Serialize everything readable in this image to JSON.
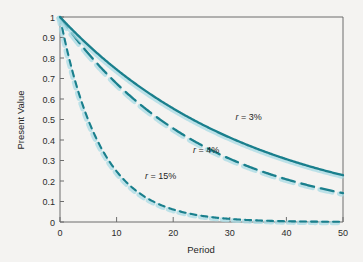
{
  "chart_data": {
    "type": "line",
    "title": "",
    "xlabel": "Period",
    "ylabel": "Present Value",
    "xlim": [
      0,
      50
    ],
    "ylim": [
      0,
      1
    ],
    "grid": false,
    "legend_position": "inline-annotations",
    "xticks": [
      "0",
      "10",
      "20",
      "30",
      "40",
      "50"
    ],
    "xtick_values": [
      0,
      10,
      20,
      30,
      40,
      50
    ],
    "yticks": [
      "0",
      "0.1",
      "0.2",
      "0.3",
      "0.4",
      "0.5",
      "0.6",
      "0.7",
      "0.8",
      "0.9",
      "1"
    ],
    "ytick_values": [
      0,
      0.1,
      0.2,
      0.3,
      0.4,
      0.5,
      0.6,
      0.7,
      0.8,
      0.9,
      1
    ],
    "x": [
      0,
      2,
      4,
      6,
      8,
      10,
      12,
      14,
      16,
      18,
      20,
      22,
      24,
      26,
      28,
      30,
      32,
      34,
      36,
      38,
      40,
      42,
      44,
      46,
      48,
      50
    ],
    "series": [
      {
        "name": "r = 3%",
        "rate": 0.03,
        "style": "solid",
        "color": "#1a7f8c",
        "values": [
          1.0,
          0.943,
          0.888,
          0.837,
          0.789,
          0.744,
          0.701,
          0.661,
          0.623,
          0.587,
          0.554,
          0.522,
          0.492,
          0.464,
          0.437,
          0.412,
          0.388,
          0.366,
          0.345,
          0.325,
          0.307,
          0.289,
          0.272,
          0.257,
          0.242,
          0.228
        ]
      },
      {
        "name": "r = 4%",
        "rate": 0.04,
        "style": "long-dash",
        "color": "#1a7f8c",
        "values": [
          1.0,
          0.925,
          0.855,
          0.79,
          0.731,
          0.676,
          0.625,
          0.577,
          0.534,
          0.494,
          0.456,
          0.422,
          0.39,
          0.361,
          0.333,
          0.308,
          0.285,
          0.264,
          0.244,
          0.225,
          0.208,
          0.193,
          0.178,
          0.165,
          0.152,
          0.141
        ]
      },
      {
        "name": "r = 15%",
        "rate": 0.15,
        "style": "short-dash",
        "color": "#1a7f8c",
        "values": [
          1.0,
          0.756,
          0.572,
          0.432,
          0.327,
          0.247,
          0.187,
          0.141,
          0.107,
          0.081,
          0.061,
          0.046,
          0.035,
          0.026,
          0.02,
          0.015,
          0.011,
          0.009,
          0.007,
          0.005,
          0.004,
          0.003,
          0.002,
          0.002,
          0.001,
          0.001
        ]
      }
    ],
    "annotations": [
      {
        "id": "label-3pct",
        "prefix": "r",
        "equals": " = ",
        "value": "3%",
        "full": "r = 3%",
        "x": 31.0,
        "y": 0.5
      },
      {
        "id": "label-4pct",
        "prefix": "r",
        "equals": " = ",
        "value": "4%",
        "full": "r = 4%",
        "x": 23.5,
        "y": 0.335
      },
      {
        "id": "label-15pct",
        "prefix": "r",
        "equals": " = ",
        "value": "15%",
        "full": "r = 15%",
        "x": 15.0,
        "y": 0.21
      }
    ]
  },
  "figure": {
    "axis_color": "#6d6d6d",
    "curve_color": "#1a7f8c",
    "halo_color": "#a8dbe4",
    "background": "#f4f3f1"
  }
}
